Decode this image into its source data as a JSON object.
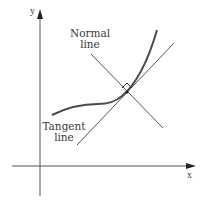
{
  "figure": {
    "axes": {
      "x_label": "x",
      "y_label": "y"
    },
    "labels": {
      "normal_line": [
        "Normal",
        "line"
      ],
      "tangent_line": [
        "Tangent",
        "line"
      ]
    },
    "colors": {
      "ink": "#3a3a3a",
      "curve": "#4a4a4a",
      "background": "#ffffff"
    },
    "annotations": {
      "right_angle_marker": "right-angle between tangent and normal at point of tangency"
    }
  }
}
